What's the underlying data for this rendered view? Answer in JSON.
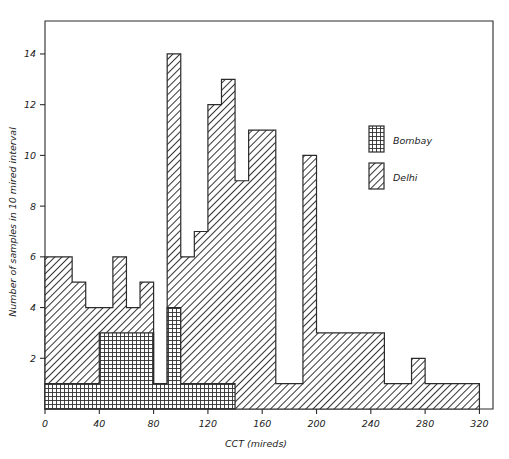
{
  "figure": {
    "background": "#ffffff",
    "ink": "#2b2b2b"
  },
  "axes": {
    "x": {
      "label": "CCT (mireds)",
      "ticks": [
        "0",
        "40",
        "80",
        "120",
        "160",
        "200",
        "240",
        "280",
        "320"
      ],
      "tick_values": [
        0,
        40,
        80,
        120,
        160,
        200,
        240,
        280,
        320
      ],
      "min": 0,
      "max": 330
    },
    "y": {
      "label": "Number of samples in 10 mired interval",
      "ticks": [
        "2",
        "4",
        "6",
        "8",
        "10",
        "12",
        "14"
      ],
      "tick_values": [
        2,
        4,
        6,
        8,
        10,
        12,
        14
      ],
      "min": 0,
      "max": 15.3
    }
  },
  "legend": {
    "items": [
      {
        "label": "Bombay",
        "pattern": "cross-hatch"
      },
      {
        "label": "Delhi",
        "pattern": "diagonal-hatch"
      }
    ]
  },
  "chart_data": {
    "type": "bar",
    "title": "",
    "subtitle": "",
    "xlabel": "CCT (mireds)",
    "ylabel": "Number of samples in 10 mired interval",
    "xlim": [
      0,
      330
    ],
    "ylim": [
      0,
      15.3
    ],
    "grid": false,
    "legend_position": "upper-right",
    "bin_width": 10,
    "categories": [
      "0-10",
      "10-20",
      "20-30",
      "30-40",
      "40-50",
      "50-60",
      "60-70",
      "70-80",
      "80-90",
      "90-100",
      "100-110",
      "110-120",
      "120-130",
      "130-140",
      "140-150",
      "150-160",
      "160-170",
      "170-180",
      "180-190",
      "190-200",
      "200-210",
      "210-220",
      "220-230",
      "230-240",
      "240-250",
      "250-260",
      "260-270",
      "270-280",
      "280-290",
      "290-300",
      "300-310",
      "310-320"
    ],
    "bin_starts": [
      0,
      10,
      20,
      30,
      40,
      50,
      60,
      70,
      80,
      90,
      100,
      110,
      120,
      130,
      140,
      150,
      160,
      170,
      180,
      190,
      200,
      210,
      220,
      230,
      240,
      250,
      260,
      270,
      280,
      290,
      300,
      310
    ],
    "series": [
      {
        "name": "Delhi",
        "pattern": "diagonal-hatch",
        "values": [
          6,
          6,
          5,
          4,
          4,
          6,
          4,
          5,
          1,
          14,
          6,
          7,
          12,
          13,
          9,
          11,
          11,
          1,
          1,
          10,
          3,
          3,
          3,
          3,
          3,
          1,
          1,
          2,
          1,
          1,
          1,
          1
        ]
      },
      {
        "name": "Bombay",
        "pattern": "cross-hatch",
        "values": [
          1,
          1,
          1,
          1,
          3,
          3,
          3,
          3,
          1,
          4,
          1,
          1,
          1,
          1,
          0,
          0,
          0,
          0,
          0,
          0,
          0,
          0,
          0,
          0,
          0,
          0,
          0,
          0,
          0,
          0,
          0,
          0
        ]
      }
    ]
  }
}
